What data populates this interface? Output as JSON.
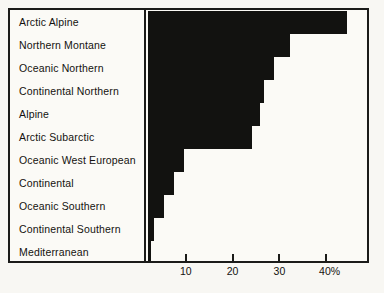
{
  "chart_data": {
    "type": "bar",
    "orientation": "horizontal",
    "title": "",
    "xlabel": "",
    "ylabel": "",
    "unit": "%",
    "xlim": [
      0,
      47.8
    ],
    "grid": false,
    "legend": null,
    "categories": [
      "Arctic Alpine",
      "Northern Montane",
      "Oceanic Northern",
      "Continental Northern",
      "Alpine",
      "Arctic Subarctic",
      "Oceanic West European",
      "Continental",
      "Oceanic Southern",
      "Continental Southern",
      "Mediterranean"
    ],
    "values": [
      42.5,
      30.3,
      26.9,
      24.8,
      24.0,
      22.2,
      7.7,
      5.5,
      3.4,
      1.3,
      0.6
    ],
    "ticks": [
      {
        "value": 10,
        "label": "10"
      },
      {
        "value": 20,
        "label": "20"
      },
      {
        "value": 30,
        "label": "30"
      },
      {
        "value": 40,
        "label": "40%"
      }
    ],
    "bar_color": "#121210",
    "axis_color": "#1b1b19",
    "background_color": "#fbfaf6"
  }
}
